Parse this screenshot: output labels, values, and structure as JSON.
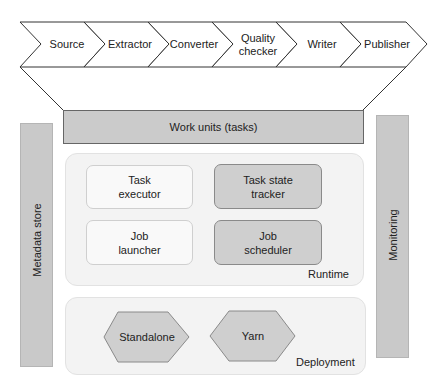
{
  "pipeline": {
    "stages": [
      {
        "label": "Source"
      },
      {
        "label": "Extractor"
      },
      {
        "label": "Converter"
      },
      {
        "label": "Quality\nchecker",
        "line1": "Quality",
        "line2": "checker"
      },
      {
        "label": "Writer"
      },
      {
        "label": "Publisher"
      }
    ]
  },
  "work_units": {
    "label": "Work units (tasks)"
  },
  "side": {
    "metadata": {
      "label": "Metadata store"
    },
    "monitoring": {
      "label": "Monitoring"
    }
  },
  "runtime": {
    "caption": "Runtime",
    "components": [
      {
        "line1": "Task",
        "line2": "executor",
        "style": "light"
      },
      {
        "line1": "Task state",
        "line2": "tracker",
        "style": "dark"
      },
      {
        "line1": "Job",
        "line2": "launcher",
        "style": "light"
      },
      {
        "line1": "Job",
        "line2": "scheduler",
        "style": "dark"
      }
    ]
  },
  "deployment": {
    "caption": "Deployment",
    "modes": [
      {
        "label": "Standalone"
      },
      {
        "label": "Yarn"
      }
    ]
  },
  "colors": {
    "bar_fill": "#c9c9c9",
    "panel_fill": "#f3f3f3",
    "dark_box": "#cfcfcf",
    "line": "#333333"
  }
}
